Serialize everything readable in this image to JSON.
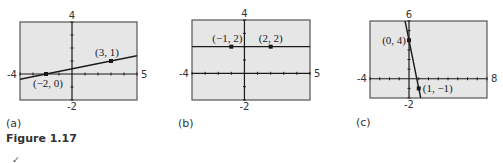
{
  "figure": {
    "label": "Figure 1.17",
    "footer_glyph": "✓"
  },
  "colors": {
    "panel_bg": "#e6e6e6",
    "ink": "#1a1a1a",
    "text": "#333333"
  },
  "chart_data": [
    {
      "type": "line",
      "panel_label": "(a)",
      "title": "",
      "xlabel": "",
      "ylabel": "",
      "xlim": [
        -4,
        5
      ],
      "ylim": [
        -2,
        4
      ],
      "x_tick_labels": [
        "-4",
        "5"
      ],
      "y_tick_labels": [
        "4",
        "-2"
      ],
      "grid": false,
      "tick_step": 1,
      "series": [
        {
          "name": "line",
          "x": [
            -4,
            5
          ],
          "y": [
            -0.4,
            1.4
          ]
        }
      ],
      "points": [
        {
          "x": -2,
          "y": 0,
          "label": "(−2, 0)",
          "label_pos": "below"
        },
        {
          "x": 3,
          "y": 1,
          "label": "(3, 1)",
          "label_pos": "above-left"
        }
      ]
    },
    {
      "type": "line",
      "panel_label": "(b)",
      "title": "",
      "xlabel": "",
      "ylabel": "",
      "xlim": [
        -4,
        5
      ],
      "ylim": [
        -2,
        4
      ],
      "x_tick_labels": [
        "-4",
        "5"
      ],
      "y_tick_labels": [
        "4",
        "-2"
      ],
      "grid": false,
      "tick_step": 1,
      "series": [
        {
          "name": "line",
          "x": [
            -4,
            5
          ],
          "y": [
            2,
            2
          ]
        }
      ],
      "points": [
        {
          "x": -1,
          "y": 2,
          "label": "(−1, 2)",
          "label_pos": "above-left"
        },
        {
          "x": 2,
          "y": 2,
          "label": "(2, 2)",
          "label_pos": "above"
        }
      ]
    },
    {
      "type": "line",
      "panel_label": "(c)",
      "title": "",
      "xlabel": "",
      "ylabel": "",
      "xlim": [
        -4,
        8
      ],
      "ylim": [
        -2,
        6
      ],
      "x_tick_labels": [
        "-4",
        "8"
      ],
      "y_tick_labels": [
        "6",
        "-2"
      ],
      "grid": false,
      "tick_step": 1,
      "series": [
        {
          "name": "line",
          "x": [
            -0.4,
            1.2
          ],
          "y": [
            6,
            -2
          ]
        }
      ],
      "points": [
        {
          "x": 0,
          "y": 4,
          "label": "(0, 4)",
          "label_pos": "left"
        },
        {
          "x": 1,
          "y": -1,
          "label": "(1, −1)",
          "label_pos": "right"
        }
      ]
    }
  ]
}
